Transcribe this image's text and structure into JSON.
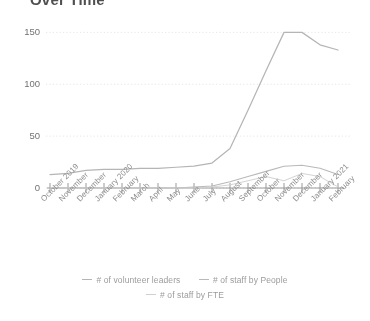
{
  "chart": {
    "title": "Over Time"
  },
  "legend": {
    "position": "bottom",
    "items": [
      {
        "label": "# of volunteer leaders",
        "color": "#b5b5b5"
      },
      {
        "label": "# of staff by People",
        "color": "#b9b9b9"
      },
      {
        "label": "# of staff by FTE",
        "color": "#d2d2d2"
      }
    ]
  },
  "chart_data": {
    "type": "line",
    "title": "Over Time",
    "xlabel": "",
    "ylabel": "",
    "ylim": [
      0,
      160
    ],
    "yticks": [
      0,
      50,
      100,
      150
    ],
    "grid": true,
    "legend_position": "bottom",
    "categories": [
      "October 2019",
      "November",
      "December",
      "January 2020",
      "February",
      "March",
      "April",
      "May",
      "June",
      "July",
      "August",
      "September",
      "October",
      "November",
      "December",
      "January 2021",
      "February"
    ],
    "series": [
      {
        "name": "# of volunteer leaders",
        "color": "#b5b5b5",
        "values": [
          13,
          14,
          17,
          18,
          18,
          19,
          19,
          20,
          21,
          24,
          38,
          75,
          113,
          150,
          150,
          138,
          133
        ]
      },
      {
        "name": "# of staff by People",
        "color": "#b9b9b9",
        "values": [
          0,
          0,
          0,
          0,
          0,
          0,
          0,
          0,
          1,
          2,
          6,
          11,
          16,
          21,
          22,
          19,
          13
        ]
      },
      {
        "name": "# of staff by FTE",
        "color": "#d2d2d2",
        "values": [
          0,
          0,
          0,
          0,
          0,
          0,
          0,
          0,
          0,
          1,
          3,
          7,
          11,
          7,
          14,
          11,
          1
        ]
      }
    ]
  }
}
